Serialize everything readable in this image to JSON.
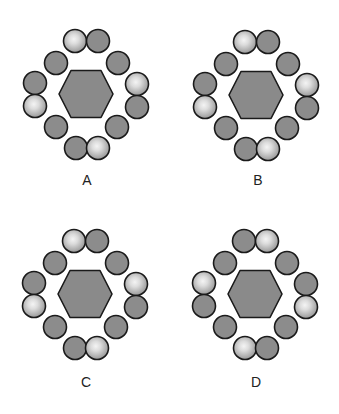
{
  "diagram": {
    "colors": {
      "background": "#ffffff",
      "hexagon_fill": "#8a8a8a",
      "dark_circle_fill": "#8c8c8c",
      "light_circle_center": "#f0f0f0",
      "light_circle_edge": "#9a9a9a",
      "stroke": "#1a1a1a",
      "label_color": "#222222"
    },
    "circle_radius": 11.5,
    "slots": [
      {
        "name": "top-left",
        "dx": -11,
        "dy": -53
      },
      {
        "name": "top-right",
        "dx": 12,
        "dy": -53
      },
      {
        "name": "upper-left-diag",
        "dx": -30,
        "dy": -31
      },
      {
        "name": "upper-right-diag",
        "dx": 32,
        "dy": -31
      },
      {
        "name": "left-upper",
        "dx": -51,
        "dy": -11
      },
      {
        "name": "left-lower",
        "dx": -51,
        "dy": 12
      },
      {
        "name": "right-upper",
        "dx": 51,
        "dy": -10
      },
      {
        "name": "right-lower",
        "dx": 51,
        "dy": 13
      },
      {
        "name": "lower-left-diag",
        "dx": -30,
        "dy": 33
      },
      {
        "name": "lower-right-diag",
        "dx": 31,
        "dy": 33
      },
      {
        "name": "bottom-left",
        "dx": -10,
        "dy": 54
      },
      {
        "name": "bottom-right",
        "dx": 12,
        "dy": 54
      }
    ],
    "options": [
      {
        "label": "A",
        "center": [
          86,
          94
        ],
        "label_pos": [
          87,
          180
        ],
        "light_slots": [
          "top-left",
          "right-upper",
          "left-lower",
          "bottom-right"
        ]
      },
      {
        "label": "B",
        "center": [
          256,
          95
        ],
        "label_pos": [
          258,
          180
        ],
        "light_slots": [
          "top-left",
          "right-upper",
          "left-lower",
          "bottom-right"
        ]
      },
      {
        "label": "C",
        "center": [
          85,
          294
        ],
        "label_pos": [
          86,
          382
        ],
        "light_slots": [
          "top-left",
          "right-upper",
          "left-lower",
          "bottom-right"
        ]
      },
      {
        "label": "D",
        "center": [
          255,
          294
        ],
        "label_pos": [
          256,
          382
        ],
        "light_slots": [
          "top-right",
          "left-upper",
          "right-lower",
          "bottom-left"
        ]
      }
    ]
  }
}
